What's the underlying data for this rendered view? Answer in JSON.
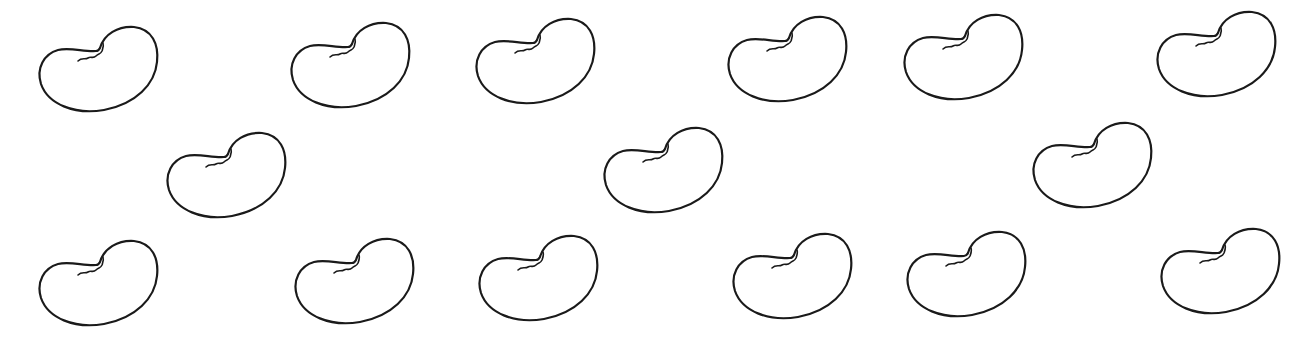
{
  "scene": {
    "background": "#ffffff",
    "stroke_color": "#1a1a1a",
    "bean_icon": "kidney-bean-outline",
    "bean_count": 15,
    "beans": [
      {
        "row": 1,
        "x": 38,
        "y": 24
      },
      {
        "row": 1,
        "x": 290,
        "y": 20
      },
      {
        "row": 1,
        "x": 475,
        "y": 16
      },
      {
        "row": 1,
        "x": 727,
        "y": 14
      },
      {
        "row": 1,
        "x": 903,
        "y": 12
      },
      {
        "row": 1,
        "x": 1156,
        "y": 9
      },
      {
        "row": 2,
        "x": 166,
        "y": 130
      },
      {
        "row": 2,
        "x": 603,
        "y": 125
      },
      {
        "row": 2,
        "x": 1032,
        "y": 120
      },
      {
        "row": 3,
        "x": 38,
        "y": 238
      },
      {
        "row": 3,
        "x": 294,
        "y": 236
      },
      {
        "row": 3,
        "x": 478,
        "y": 233
      },
      {
        "row": 3,
        "x": 732,
        "y": 231
      },
      {
        "row": 3,
        "x": 906,
        "y": 229
      },
      {
        "row": 3,
        "x": 1160,
        "y": 226
      }
    ]
  }
}
